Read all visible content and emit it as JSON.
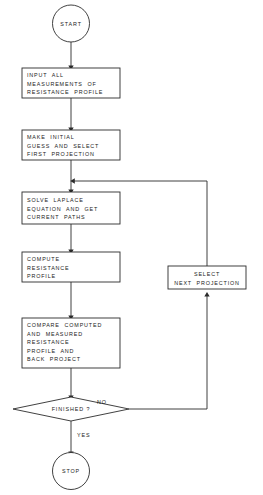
{
  "diagram": {
    "stroke_color": "#2b2b2b",
    "text_color": "#1a1a1a",
    "background_color": "#ffffff"
  },
  "nodes": {
    "start": {
      "label": "START",
      "shape": "circle"
    },
    "input_measurements": {
      "shape": "process",
      "lines": [
        "INPUT  ALL",
        "MEASUREMENTS  OF",
        "RESISTANCE  PROFILE"
      ],
      "text": "INPUT  ALL\nMEASUREMENTS  OF\nRESISTANCE  PROFILE"
    },
    "initial_guess": {
      "shape": "process",
      "lines": [
        "MAKE  INITIAL",
        "GUESS  AND  SELECT",
        "FIRST  PROJECTION"
      ],
      "text": "MAKE  INITIAL\nGUESS  AND  SELECT\nFIRST  PROJECTION"
    },
    "solve_laplace": {
      "shape": "process",
      "lines": [
        "SOLVE  LAPLACE",
        "EQUATION  AND  GET",
        "CURRENT  PATHS"
      ],
      "text": "SOLVE  LAPLACE\nEQUATION  AND  GET\nCURRENT  PATHS"
    },
    "compute_resistance": {
      "shape": "process",
      "lines": [
        "COMPUTE",
        "RESISTANCE",
        "PROFILE"
      ],
      "text": "COMPUTE\nRESISTANCE\nPROFILE"
    },
    "compare_backproject": {
      "shape": "process",
      "lines": [
        "COMPARE  COMPUTED",
        "AND  MEASURED",
        "RESISTANCE",
        "PROFILE  AND",
        "BACK  PROJECT"
      ],
      "text": "COMPARE  COMPUTED\nAND  MEASURED\nRESISTANCE\nPROFILE  AND\nBACK  PROJECT"
    },
    "select_next_projection": {
      "shape": "process",
      "lines": [
        "SELECT",
        "NEXT  PROJECTION"
      ],
      "text": "SELECT\nNEXT  PROJECTION"
    },
    "finished_decision": {
      "shape": "diamond",
      "label": "FINISHED ?"
    },
    "stop": {
      "label": "STOP",
      "shape": "circle"
    }
  },
  "edges": {
    "no_label": "NO",
    "yes_label": "YES"
  }
}
